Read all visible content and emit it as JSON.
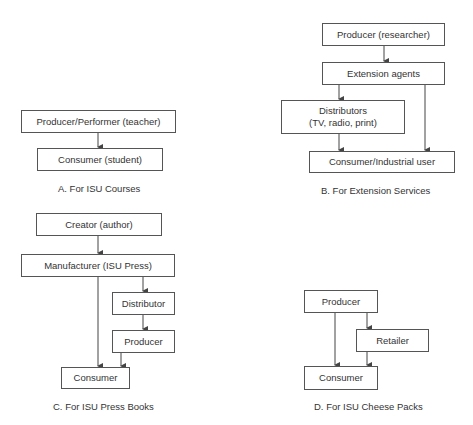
{
  "diagrams": {
    "a": {
      "caption": "A.  For ISU Courses",
      "nodes": {
        "producer": "Producer/Performer (teacher)",
        "consumer": "Consumer (student)"
      }
    },
    "b": {
      "caption": "B.  For Extension Services",
      "nodes": {
        "producer": "Producer (researcher)",
        "extension": "Extension agents",
        "distributors_line1": "Distributors",
        "distributors_line2": "(TV, radio, print)",
        "consumer": "Consumer/Industrial user"
      }
    },
    "c": {
      "caption": "C.  For ISU Press Books",
      "nodes": {
        "creator": "Creator (author)",
        "manufacturer": "Manufacturer (ISU Press)",
        "distributor": "Distributor",
        "producer": "Producer",
        "consumer": "Consumer"
      }
    },
    "d": {
      "caption": "D.  For ISU Cheese Packs",
      "nodes": {
        "producer": "Producer",
        "retailer": "Retailer",
        "consumer": "Consumer"
      }
    }
  },
  "colors": {
    "line": "#444444",
    "text": "#333333",
    "background": "#ffffff"
  }
}
